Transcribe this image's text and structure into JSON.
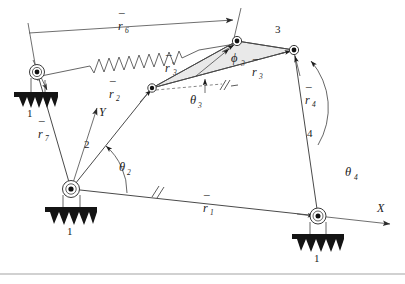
{
  "figure": {
    "name": "four-bar-linkage-kinematic-diagram",
    "type": "mechanism-schematic",
    "background_color": "#ffffff",
    "line_color": "#4a4a4a",
    "shade_color": "#e9e9e9",
    "ground_color": "#141414"
  },
  "labels": {
    "r1": "r",
    "r1_sub": "1",
    "r2": "r",
    "r2_sub": "2",
    "r3": "r",
    "r3_sub": "3",
    "r3p": "r",
    "r3p_sub": "3",
    "r3p_prime": "′",
    "r4": "r",
    "r4_sub": "4",
    "r6": "r",
    "r6_sub": "6",
    "r7": "r",
    "r7_sub": "7",
    "theta2": "θ",
    "theta2_sub": "2",
    "theta3": "θ",
    "theta3_sub": "3",
    "theta4": "θ",
    "theta4_sub": "4",
    "phi3": "ϕ",
    "phi3_sub": "3",
    "axis_x": "X",
    "axis_y": "Y",
    "link1_a": "1",
    "link1_b": "1",
    "link1_c": "1",
    "link2": "2",
    "link3": "3",
    "link4": "4"
  },
  "nodes": {
    "ground_left_pivot": {
      "label": "upper-left-ground-pivot",
      "x": 37,
      "y": 72
    },
    "crank_pivot": {
      "label": "crank-ground-pivot",
      "x": 71,
      "y": 189
    },
    "coupler_joint": {
      "label": "coupler-left-joint",
      "x": 152,
      "y": 88
    },
    "apex_joint": {
      "label": "coupler-apex-joint",
      "x": 237,
      "y": 41
    },
    "rocker_joint": {
      "label": "coupler-rocker-joint",
      "x": 294,
      "y": 50
    },
    "rocker_ground": {
      "label": "rocker-ground-pivot",
      "x": 318,
      "y": 216
    }
  },
  "elements": {
    "spring": "spring-zigzag",
    "ground_hatch": "ground-hatch-symbol",
    "pivot": "revolute-pivot-symbol",
    "parallel_tick": "parallel-tick-mark",
    "arrowhead": "arrowhead"
  }
}
